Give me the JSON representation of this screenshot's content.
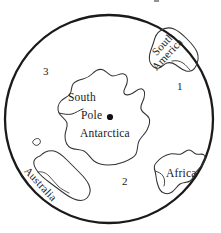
{
  "figure": {
    "type": "polar-projection-world-map",
    "background_color": "#ffffff",
    "line_color": "#1a1a1a",
    "projection_center": "South Pole",
    "globe": {
      "center_x": 109,
      "center_y": 119,
      "radius": 104,
      "stroke_width": 2.2
    }
  },
  "labels": {
    "antarctica": "Antarctica",
    "south_pole_line1": "South",
    "south_pole_line2": "Pole",
    "south_america_line1": "South",
    "south_america_line2": "America",
    "africa": "Africa",
    "australia": "Australia"
  },
  "regions": [
    {
      "number": "1",
      "x": 177,
      "y": 86
    },
    {
      "number": "2",
      "x": 122,
      "y": 181
    },
    {
      "number": "3",
      "x": 43,
      "y": 71
    }
  ],
  "markers": [
    {
      "name": "south-pole-dot",
      "x": 110,
      "y": 117,
      "radius": 3.1
    }
  ],
  "colors": {
    "ink": "#1a1a1a",
    "coastline": "#333333",
    "paper": "#ffffff"
  }
}
